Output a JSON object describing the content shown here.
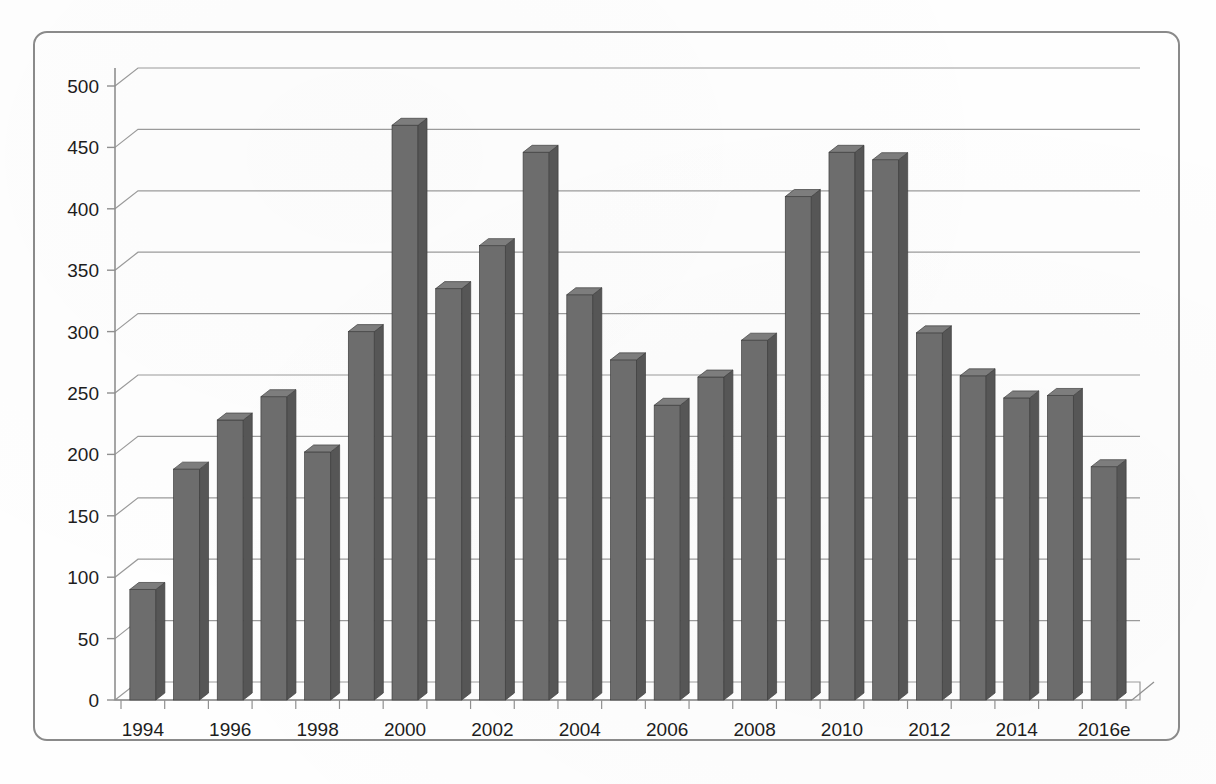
{
  "chart_data": {
    "type": "bar",
    "title": "",
    "subtitle": "",
    "xlabel": "",
    "ylabel": "",
    "categories": [
      "1994",
      "1995",
      "1996",
      "1997",
      "1998",
      "1999",
      "2000",
      "2001",
      "2002",
      "2003",
      "2004",
      "2005",
      "2006",
      "2007",
      "2008",
      "2009",
      "2010",
      "2011",
      "2012",
      "2013",
      "2014",
      "2015",
      "2016e"
    ],
    "values": [
      90,
      188,
      228,
      247,
      202,
      300,
      468,
      335,
      370,
      446,
      330,
      277,
      240,
      263,
      293,
      410,
      446,
      440,
      299,
      264,
      246,
      248,
      190
    ],
    "ylim": [
      0,
      500
    ],
    "ytick_values": [
      0,
      50,
      100,
      150,
      200,
      250,
      300,
      350,
      400,
      450,
      500
    ],
    "ytick_labels": [
      "0",
      "50",
      "100",
      "150",
      "200",
      "250",
      "300",
      "350",
      "400",
      "450",
      "500"
    ],
    "xtick_labels": [
      "1994",
      "1996",
      "1998",
      "2000",
      "2002",
      "2004",
      "2006",
      "2008",
      "2010",
      "2012",
      "2014",
      "2016e"
    ],
    "grid": true,
    "legend": false,
    "legend_position": "none",
    "style": "3d-column",
    "annotations": []
  },
  "style": {
    "bar_front_color": "#6d6d6d",
    "bar_side_color": "#565656",
    "bar_top_color": "#7d7d7d",
    "bar_edge_color": "#3f3f3f",
    "grid_color": "#9a9a9a",
    "axis_color": "#8f8f8f",
    "frame_color": "#8a8a8a",
    "text_color": "#1d1d1d",
    "background_color": "#fefefe"
  },
  "geometry": {
    "plot_left": 115,
    "plot_right": 1140,
    "plot_bottom": 700,
    "plot_top": 86,
    "depth_dx": 23,
    "depth_dy": 18,
    "bar_width": 26,
    "bar_side_width": 9
  }
}
